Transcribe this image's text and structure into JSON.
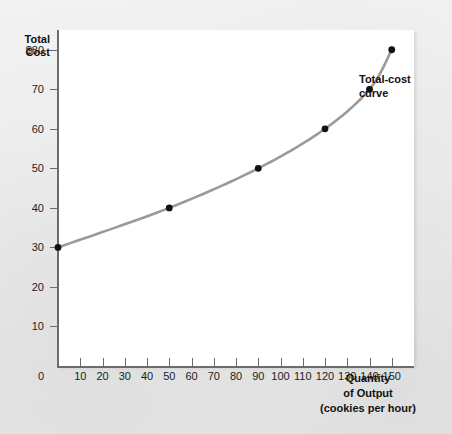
{
  "figure": {
    "y_axis_title": "Total\nCost",
    "x_axis_title": "Quantity\nof Output\n(cookies per hour)",
    "series_label": "Total-cost\ncurve"
  },
  "chart_data": {
    "type": "line",
    "title": "",
    "subtitle": "",
    "xlabel": "Quantity of Output (cookies per hour)",
    "ylabel": "Total Cost",
    "xlim": [
      0,
      160
    ],
    "ylim": [
      0,
      85
    ],
    "grid": false,
    "legend_position": "inline-right",
    "x_ticks": [
      0,
      10,
      20,
      30,
      40,
      50,
      60,
      70,
      80,
      90,
      100,
      110,
      120,
      130,
      140,
      150
    ],
    "x_tick_labels": [
      "0",
      "10",
      "20",
      "30",
      "40",
      "50",
      "60",
      "70",
      "80",
      "90",
      "100",
      "110",
      "120",
      "130",
      "140",
      "150"
    ],
    "y_ticks": [
      10,
      20,
      30,
      40,
      50,
      60,
      70,
      80
    ],
    "y_tick_labels": [
      "10",
      "20",
      "30",
      "40",
      "50",
      "60",
      "70",
      "$80"
    ],
    "series": [
      {
        "name": "Total-cost curve",
        "color": "#9a9a9a",
        "marker_color": "#111111",
        "x": [
          0,
          50,
          90,
          120,
          140,
          150
        ],
        "y": [
          30,
          40,
          50,
          60,
          70,
          80
        ],
        "points": [
          {
            "x": 0,
            "y": 30
          },
          {
            "x": 50,
            "y": 40
          },
          {
            "x": 90,
            "y": 50
          },
          {
            "x": 120,
            "y": 60
          },
          {
            "x": 140,
            "y": 70
          },
          {
            "x": 150,
            "y": 80
          }
        ]
      }
    ],
    "annotations": [
      {
        "text": "Total-cost curve",
        "x": 150,
        "y": 80
      }
    ]
  },
  "colors": {
    "curve": "#9a9a9a",
    "marker": "#111111",
    "axis": "#6b6b6b",
    "panel": "#ffffff",
    "page": "#ebebeb",
    "text": "#1c1c1c"
  }
}
